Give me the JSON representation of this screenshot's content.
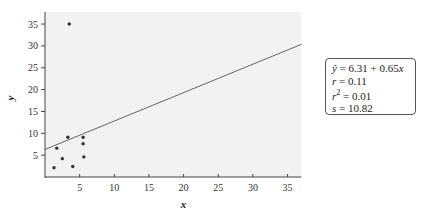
{
  "chart_data": {
    "type": "scatter",
    "title": "",
    "xlabel": "x",
    "ylabel": "y",
    "xlim": [
      0,
      37
    ],
    "ylim": [
      0,
      37
    ],
    "xticks": [
      5,
      10,
      15,
      20,
      25,
      30,
      35
    ],
    "yticks": [
      5,
      10,
      15,
      20,
      25,
      30,
      35
    ],
    "grid": false,
    "points": [
      {
        "x": 3.5,
        "y": 35.0
      },
      {
        "x": 3.3,
        "y": 9.1
      },
      {
        "x": 5.5,
        "y": 9.1
      },
      {
        "x": 1.7,
        "y": 6.6
      },
      {
        "x": 5.5,
        "y": 7.6
      },
      {
        "x": 2.5,
        "y": 4.2
      },
      {
        "x": 5.6,
        "y": 4.6
      },
      {
        "x": 1.3,
        "y": 2.1
      },
      {
        "x": 4.0,
        "y": 2.4
      }
    ],
    "regression_line": {
      "intercept": 6.31,
      "slope": 0.65
    },
    "annotation": {
      "lines": [
        "ŷ = 6.31 + 0.65x",
        "r = 0.11",
        "r² = 0.01",
        "s = 10.82"
      ]
    }
  },
  "stats": {
    "eq_lhs": "ŷ",
    "eq_rhs": " = 6.31 + 0.65",
    "eq_var": "x",
    "r_label": "r",
    "r_value": " = 0.11",
    "r2_label": "r",
    "r2_sup": "2",
    "r2_value": " = 0.01",
    "s_label": "s",
    "s_value": " = 10.82"
  },
  "colors": {
    "plot_bg": "#f2f2f2",
    "axis": "#444444",
    "point": "#333333",
    "line": "#555555"
  }
}
